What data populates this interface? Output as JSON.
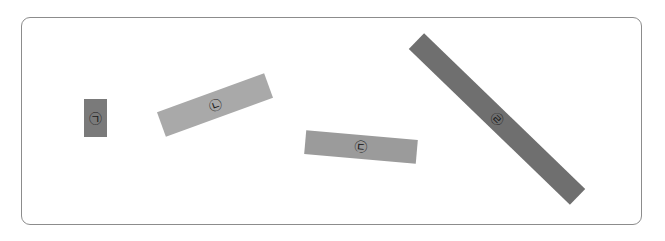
{
  "figure": {
    "frame": {
      "border_color": "#8c8c8c"
    },
    "objects": [
      {
        "id": "a",
        "label": "㉠",
        "cx": 95,
        "cy": 118,
        "length": 23,
        "thickness": 38,
        "angle": 0,
        "color": "#7a7a7a"
      },
      {
        "id": "b",
        "label": "㉡",
        "cx": 215,
        "cy": 105,
        "length": 114,
        "thickness": 26,
        "angle": -20,
        "color": "#a9a9a9"
      },
      {
        "id": "c",
        "label": "㉢",
        "cx": 361,
        "cy": 147,
        "length": 112,
        "thickness": 24,
        "angle": 5,
        "color": "#9b9b9b"
      },
      {
        "id": "d",
        "label": "㉣",
        "cx": 497,
        "cy": 119,
        "length": 224,
        "thickness": 22,
        "angle": 44,
        "color": "#6f6f6f"
      }
    ]
  }
}
